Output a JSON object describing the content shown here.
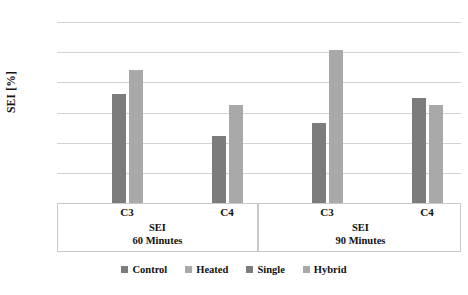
{
  "chart_data": {
    "type": "bar",
    "title": "",
    "xlabel": "SEI",
    "ylabel": "SEI [%]",
    "ylim": [
      0,
      30
    ],
    "ytick_step": 5,
    "ytick_labels": [
      "30",
      "25",
      "20",
      "15",
      "10",
      "5",
      "0"
    ],
    "grid": true,
    "legend_position": "bottom",
    "categories": [
      "C3",
      "C4"
    ],
    "groups": [
      {
        "name": "SEI",
        "subtitle": "60 Minutes",
        "label_line1": "SEI",
        "label_line2": "60 Minutes",
        "categories": [
          {
            "label": "C3",
            "bars": [
              {
                "series": "Control",
                "value": 18.0,
                "color": "#7c7c7c"
              },
              {
                "series": "Heated",
                "value": 22.1,
                "color": "#a9a9a9"
              }
            ]
          },
          {
            "label": "C4",
            "bars": [
              {
                "series": "Control",
                "value": 11.1,
                "color": "#7c7c7c"
              },
              {
                "series": "Heated",
                "value": 16.2,
                "color": "#a9a9a9"
              }
            ]
          }
        ]
      },
      {
        "name": "SEI",
        "subtitle": "90 Minutes",
        "label_line1": "SEI",
        "label_line2": "90 Minutes",
        "categories": [
          {
            "label": "C3",
            "bars": [
              {
                "series": "Single",
                "value": 13.3,
                "color": "#7c7c7c"
              },
              {
                "series": "Hybrid",
                "value": 25.3,
                "color": "#a9a9a9"
              }
            ]
          },
          {
            "label": "C4",
            "bars": [
              {
                "series": "Single",
                "value": 17.4,
                "color": "#7c7c7c"
              },
              {
                "series": "Hybrid",
                "value": 16.3,
                "color": "#a9a9a9"
              }
            ]
          }
        ]
      }
    ],
    "series": [
      {
        "name": "Control",
        "color": "#7c7c7c",
        "values": [
          18.0,
          11.1
        ]
      },
      {
        "name": "Heated",
        "color": "#a9a9a9",
        "values": [
          22.1,
          16.2
        ]
      },
      {
        "name": "Single",
        "color": "#7c7c7c",
        "values": [
          13.3,
          17.4
        ]
      },
      {
        "name": "Hybrid",
        "color": "#a9a9a9",
        "values": [
          25.3,
          16.3
        ]
      }
    ],
    "legend": [
      {
        "label": "Control",
        "color": "#7c7c7c"
      },
      {
        "label": "Heated",
        "color": "#a9a9a9"
      },
      {
        "label": "Single",
        "color": "#7c7c7c"
      },
      {
        "label": "Hybrid",
        "color": "#a9a9a9"
      }
    ]
  },
  "axis": {
    "y_title": "SEI [%]",
    "y_ticks": [
      "30",
      "25",
      "20",
      "15",
      "10",
      "5",
      "0"
    ]
  },
  "colors": {
    "bar_dark": "#7c7c7c",
    "bar_light": "#a9a9a9",
    "gridline": "#d3d3d3",
    "frame": "#c9c9c9",
    "text": "#111111"
  }
}
